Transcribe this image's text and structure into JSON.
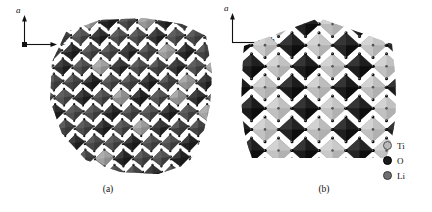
{
  "figure": {
    "background_color": "#ffffff",
    "panels": [
      {
        "id": "a",
        "caption": "(a)",
        "axes": {
          "vertical_label": "a",
          "horizontal_label": "c"
        },
        "view": "polyhedral crystal structure projected along b",
        "description": "dense network of corner- and edge-sharing TiO6 octahedra with interspersed Li polyhedra"
      },
      {
        "id": "b",
        "caption": "(b)",
        "axes": {
          "vertical_label": "a",
          "horizontal_label": "b"
        },
        "view": "polyhedral crystal structure projected along c",
        "description": "checkerboard array of dark TiO6 octahedra alternating with light Li polyhedra"
      }
    ]
  },
  "legend": {
    "items": [
      {
        "label": "Ti",
        "color": "#b9b9b9",
        "marker": "circle-marker"
      },
      {
        "label": "O",
        "color": "#1b1b1b",
        "marker": "circle-marker"
      },
      {
        "label": "Li",
        "color": "#6f6f6f",
        "marker": "circle-marker"
      }
    ]
  },
  "structure_a": {
    "cols": 9,
    "rows": 9,
    "cell": 19,
    "tilt": 0.3,
    "dark": "#2b2b2b",
    "mid": "#4a4a4a",
    "light": "#9a9a9a",
    "vertex": "#0d0d0d"
  },
  "structure_b": {
    "cols": 6,
    "rows": 7,
    "cell": 27,
    "dark": "#202020",
    "light": "#c2c2c2",
    "mid": "#6e6e6e",
    "vertex": "#0a0a0a"
  }
}
